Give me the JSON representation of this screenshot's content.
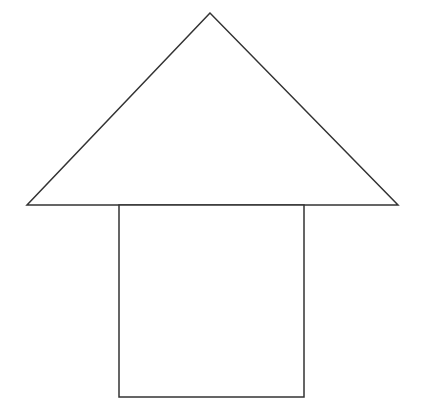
{
  "diagram": {
    "background": "#ffffff",
    "stroke_color": "#333333",
    "stroke_width": 1.5,
    "shapes": {
      "roof_triangle": {
        "type": "triangle",
        "points": [
          [
            210,
            13
          ],
          [
            27,
            205
          ],
          [
            398,
            205
          ]
        ],
        "fill": "#ffffff"
      },
      "body_rectangle": {
        "type": "rectangle",
        "x": 119,
        "y": 205,
        "width": 185,
        "height": 192,
        "fill": "#ffffff"
      }
    }
  }
}
